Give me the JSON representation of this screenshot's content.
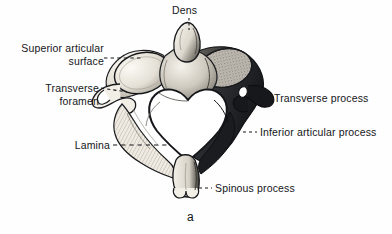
{
  "figure": {
    "caption": "a",
    "ink_color": "#15161a",
    "paper_color": "#fefefe",
    "bone_light": "#f4f1ea",
    "bone_shadow": "#6d6a64",
    "bone_dark": "#1d1e21"
  },
  "labels": {
    "dens": {
      "text": "Dens",
      "x": 176,
      "y": 4,
      "align": "center",
      "leader": "vertical-dashed"
    },
    "superior_articular_surface": {
      "line1": "Superior articular",
      "line2": "surface",
      "x": 8,
      "y": 42,
      "align": "right",
      "leader": "horizontal-dashed"
    },
    "transverse_foramen": {
      "line1": "Transverse",
      "line2": "foramen",
      "x": 30,
      "y": 82,
      "align": "right",
      "leader": "horizontal-dashed"
    },
    "lamina": {
      "text": "Lamina",
      "x": 70,
      "y": 139,
      "align": "right",
      "leader": "long-dashed"
    },
    "transverse_process": {
      "text": "Transverse process",
      "x": 272,
      "y": 91,
      "align": "left",
      "leader": "short-dashed"
    },
    "inferior_articular_process": {
      "text": "Inferior articular process",
      "x": 258,
      "y": 126,
      "align": "left",
      "leader": "short-dashed"
    },
    "spinous_process": {
      "text": "Spinous process",
      "x": 213,
      "y": 181,
      "align": "left",
      "leader": "short-dashed"
    }
  },
  "caption_block": {
    "text": "a",
    "x": 187,
    "y": 210
  }
}
